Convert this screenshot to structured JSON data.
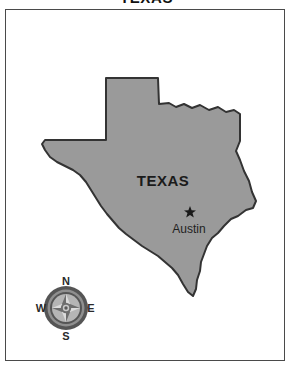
{
  "title": "TEXAS",
  "frame": {
    "border_color": "#4a4a4a",
    "background_color": "#ffffff"
  },
  "map": {
    "state_name": "TEXAS",
    "fill_color": "#9a9a9a",
    "outline_color": "#333333",
    "label": "TEXAS",
    "city": {
      "name": "Austin",
      "marker": "star-marker"
    }
  },
  "compass": {
    "name": "compass-rose",
    "north": "N",
    "east": "E",
    "south": "S",
    "west": "W",
    "ring_color": "#555555",
    "face_color": "#b5b5b5",
    "star_light": "#d6d6d6",
    "star_dark": "#6e6e6e"
  }
}
